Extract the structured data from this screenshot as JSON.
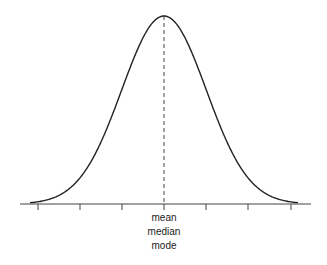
{
  "diagram": {
    "type": "normal-distribution",
    "center_labels": [
      "mean",
      "median",
      "mode"
    ],
    "colors": {
      "curve": "#222222",
      "axis": "#444444",
      "dashed": "#444444"
    },
    "tick_count": 7
  },
  "chart_data": {
    "type": "line",
    "title": "",
    "xlabel": "",
    "ylabel": "",
    "x": [
      -3,
      -2,
      -1,
      0,
      1,
      2,
      3
    ],
    "series": [
      {
        "name": "normal curve",
        "values": [
          0.0044,
          0.054,
          0.242,
          0.399,
          0.242,
          0.054,
          0.0044
        ]
      }
    ],
    "annotations": [
      "mean",
      "median",
      "mode"
    ],
    "grid": false
  }
}
